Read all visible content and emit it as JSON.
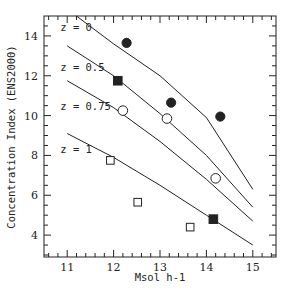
{
  "chart_data": {
    "type": "scatter",
    "title": "",
    "xlabel": "Msol h-1",
    "ylabel": "Concentration Index (ENS2000)",
    "xlim": [
      10.5,
      15.5
    ],
    "ylim": [
      2.9,
      15.0
    ],
    "xticks": [
      11,
      12,
      13,
      14,
      15
    ],
    "yticks": [
      4,
      6,
      8,
      10,
      12,
      14
    ],
    "grid": false,
    "legend": "none (inline curve labels)",
    "lines": [
      {
        "name": "z = 0",
        "label_pos": [
          10.85,
          14.25
        ],
        "points": [
          [
            11.2,
            15.0
          ],
          [
            12.0,
            13.6
          ],
          [
            13.0,
            12.0
          ],
          [
            14.0,
            9.9
          ],
          [
            15.0,
            6.3
          ]
        ]
      },
      {
        "name": "z = 0.5",
        "label_pos": [
          10.85,
          12.25
        ],
        "points": [
          [
            11.0,
            13.5
          ],
          [
            12.0,
            12.0
          ],
          [
            13.0,
            10.1
          ],
          [
            14.0,
            8.0
          ],
          [
            15.0,
            5.4
          ]
        ]
      },
      {
        "name": "z = 0.75",
        "label_pos": [
          10.85,
          10.3
        ],
        "points": [
          [
            11.0,
            11.75
          ],
          [
            12.0,
            10.4
          ],
          [
            13.0,
            8.7
          ],
          [
            14.0,
            6.8
          ],
          [
            15.0,
            4.7
          ]
        ]
      },
      {
        "name": "z = 1",
        "label_pos": [
          10.85,
          8.1
        ],
        "points": [
          [
            11.0,
            9.1
          ],
          [
            12.0,
            7.9
          ],
          [
            13.0,
            6.5
          ],
          [
            14.0,
            5.0
          ],
          [
            15.0,
            3.5
          ]
        ]
      }
    ],
    "series": [
      {
        "name": "filled-circles",
        "marker": "circle",
        "filled": true,
        "points": [
          [
            12.28,
            13.65
          ],
          [
            13.24,
            10.65
          ],
          [
            14.3,
            9.95
          ]
        ]
      },
      {
        "name": "filled-squares",
        "marker": "square",
        "filled": true,
        "points": [
          [
            12.09,
            11.75
          ],
          [
            14.15,
            4.8
          ]
        ]
      },
      {
        "name": "open-circles",
        "marker": "circle",
        "filled": false,
        "points": [
          [
            12.2,
            10.25
          ],
          [
            13.15,
            9.85
          ],
          [
            14.2,
            6.85
          ]
        ]
      },
      {
        "name": "open-squares",
        "marker": "square",
        "filled": false,
        "points": [
          [
            11.93,
            7.75
          ],
          [
            12.52,
            5.65
          ],
          [
            13.65,
            4.4
          ]
        ]
      }
    ]
  },
  "colors": {
    "ink": "#222222",
    "background": "#ffffff"
  }
}
